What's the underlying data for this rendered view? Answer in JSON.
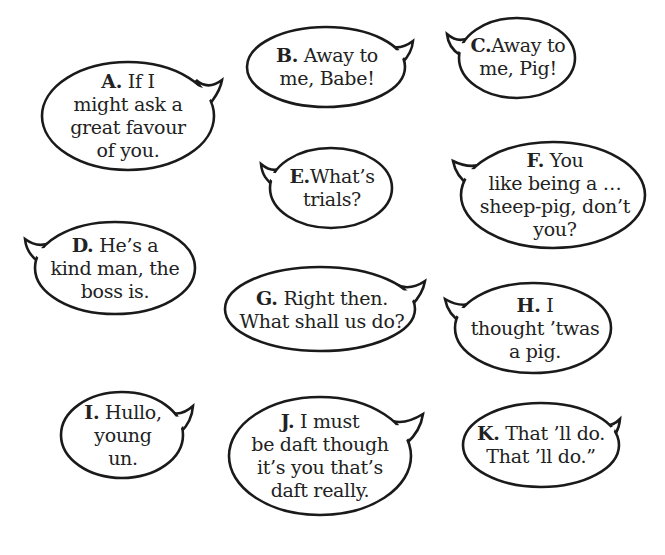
{
  "page": {
    "background": "#ffffff",
    "stroke_color": "#1a1a1a",
    "text_color": "#222222"
  },
  "bubbles": [
    {
      "id": "A",
      "letter": "A.",
      "tail": "top-right",
      "lines": [
        " If I",
        "might ask a",
        "great favour",
        "of you."
      ],
      "ellipse": {
        "cx": 128,
        "cy": 116,
        "rx": 86,
        "ry": 54
      },
      "text_box": {
        "x": 52,
        "y": 68,
        "w": 152,
        "h": 96
      }
    },
    {
      "id": "B",
      "letter": "B.",
      "tail": "top-right",
      "lines": [
        " Away to",
        "me, Babe!"
      ],
      "ellipse": {
        "cx": 326,
        "cy": 67,
        "rx": 79,
        "ry": 40
      },
      "text_box": {
        "x": 262,
        "y": 40,
        "w": 130,
        "h": 54
      }
    },
    {
      "id": "C",
      "letter": "C.",
      "tail": "top-left",
      "lines": [
        "Away to",
        "me, Pig!"
      ],
      "ellipse": {
        "cx": 517,
        "cy": 58,
        "rx": 58,
        "ry": 40
      },
      "text_box": {
        "x": 468,
        "y": 30,
        "w": 102,
        "h": 54
      }
    },
    {
      "id": "D",
      "letter": "D.",
      "tail": "top-left",
      "lines": [
        " He’s a",
        "kind man, the",
        "boss is."
      ],
      "ellipse": {
        "cx": 115,
        "cy": 268,
        "rx": 80,
        "ry": 46
      },
      "text_box": {
        "x": 42,
        "y": 232,
        "w": 146,
        "h": 72
      }
    },
    {
      "id": "E",
      "letter": "E.",
      "tail": "top-left",
      "lines": [
        "What’s",
        "trials?"
      ],
      "ellipse": {
        "cx": 331,
        "cy": 188,
        "rx": 61,
        "ry": 40
      },
      "text_box": {
        "x": 280,
        "y": 161,
        "w": 104,
        "h": 54
      }
    },
    {
      "id": "F",
      "letter": "F.",
      "tail": "top-left",
      "lines": [
        " You",
        "like being a …",
        "sheep-pig, don’t",
        "you?"
      ],
      "ellipse": {
        "cx": 553,
        "cy": 195,
        "rx": 92,
        "ry": 53
      },
      "text_box": {
        "x": 474,
        "y": 146,
        "w": 162,
        "h": 98
      }
    },
    {
      "id": "G",
      "letter": "G.",
      "tail": "top-right",
      "lines": [
        " Right then.",
        "What shall us do?"
      ],
      "ellipse": {
        "cx": 320,
        "cy": 309,
        "rx": 95,
        "ry": 42
      },
      "text_box": {
        "x": 233,
        "y": 283,
        "w": 178,
        "h": 54
      }
    },
    {
      "id": "H",
      "letter": "H.",
      "tail": "top-left",
      "lines": [
        " I",
        "thought ’twas",
        "a pig."
      ],
      "ellipse": {
        "cx": 533,
        "cy": 328,
        "rx": 78,
        "ry": 45
      },
      "text_box": {
        "x": 466,
        "y": 292,
        "w": 140,
        "h": 72
      }
    },
    {
      "id": "I",
      "letter": "I.",
      "tail": "top-right",
      "lines": [
        " Hullo,",
        "young",
        "un."
      ],
      "ellipse": {
        "cx": 122,
        "cy": 435,
        "rx": 61,
        "ry": 43
      },
      "text_box": {
        "x": 72,
        "y": 399,
        "w": 104,
        "h": 72
      }
    },
    {
      "id": "J",
      "letter": "J.",
      "tail": "top-right",
      "lines": [
        " I must",
        "be daft though",
        "it’s you that’s",
        "daft really."
      ],
      "ellipse": {
        "cx": 320,
        "cy": 456,
        "rx": 91,
        "ry": 59
      },
      "text_box": {
        "x": 240,
        "y": 408,
        "w": 160,
        "h": 96
      }
    },
    {
      "id": "K",
      "letter": "K.",
      "tail": "top-right",
      "lines": [
        " That ’ll do.",
        "That ’ll do.”"
      ],
      "ellipse": {
        "cx": 541,
        "cy": 445,
        "rx": 78,
        "ry": 42
      },
      "text_box": {
        "x": 466,
        "y": 418,
        "w": 150,
        "h": 54
      }
    }
  ]
}
